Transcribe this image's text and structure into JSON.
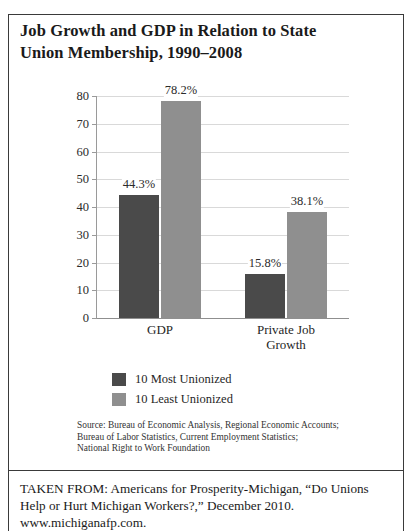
{
  "figure": {
    "title_line1": "Job Growth and GDP in Relation to State",
    "title_line2": "Union Membership, 1990–2008"
  },
  "chart_data": {
    "type": "bar",
    "title": "Job Growth and GDP in Relation to State Union Membership, 1990–2008",
    "xlabel": "",
    "ylabel": "",
    "ylim": [
      0,
      80
    ],
    "ytick_labels": [
      "80",
      "70",
      "60",
      "50",
      "40",
      "30",
      "20",
      "10",
      "0"
    ],
    "ytick_values": [
      80,
      70,
      60,
      50,
      40,
      30,
      20,
      10,
      0
    ],
    "grid": true,
    "legend_position": "bottom-left",
    "categories": [
      "GDP",
      "Private Job\nGrowth"
    ],
    "series": [
      {
        "name": "10 Most Unionized",
        "color": "#4a4a4a",
        "values": [
          44.3,
          15.8
        ],
        "labels": [
          "44.3%",
          "15.8%"
        ]
      },
      {
        "name": "10 Least Unionized",
        "color": "#8f8f8f",
        "values": [
          78.2,
          38.1
        ],
        "labels": [
          "78.2%",
          "38.1%"
        ]
      }
    ]
  },
  "source": {
    "line1": "Source: Bureau of Economic Analysis, Regional Economic Accounts;",
    "line2": "Bureau of Labor Statistics, Current Employment Statistics;",
    "line3": "National Right to Work Foundation"
  },
  "attribution": {
    "line1": "TAKEN FROM: Americans for Prosperity-Michigan, “Do Unions",
    "line2": "Help or Hurt Michigan Workers?,” December 2010.",
    "line3": "www.michiganafp.com."
  }
}
